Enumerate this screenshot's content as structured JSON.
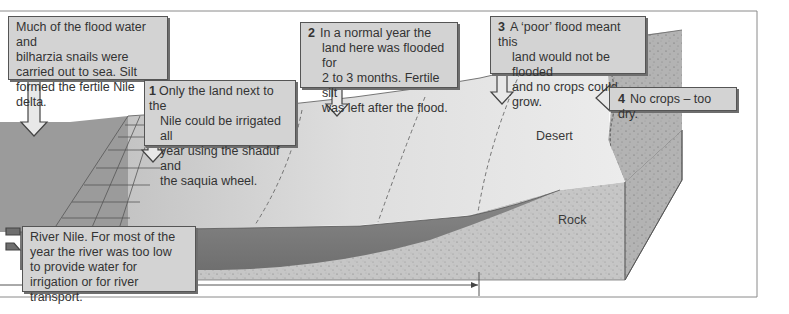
{
  "diagram": {
    "colors": {
      "river": "#7d7d7d",
      "delta_water": "#9a9a9a",
      "flood_land": "#c9c9c9",
      "desert": "#e6e6e6",
      "rock": "#c4c4c4",
      "callout_fill": "#d3d3d3",
      "frame": "#8a8a8a"
    },
    "callouts": [
      {
        "id": "delta",
        "number": "",
        "lines": [
          "Much of the flood water and",
          "bilharzia snails were",
          "carried out to sea. Silt",
          "formed the fertile Nile delta."
        ]
      },
      {
        "id": "irrigated",
        "number": "1",
        "lines": [
          "Only the land next to the",
          "Nile could be irrigated all",
          "year using the shaduf and",
          "the saquia wheel."
        ]
      },
      {
        "id": "normal-flood",
        "number": "2",
        "lines": [
          "In a normal year the",
          "land here was flooded for",
          "2 to 3 months. Fertile silt",
          "was left after the flood."
        ]
      },
      {
        "id": "poor-flood",
        "number": "3",
        "lines": [
          "A ‘poor’ flood meant this",
          "land would not be flooded",
          "and no crops could grow."
        ]
      },
      {
        "id": "too-dry",
        "number": "4",
        "lines": [
          "No crops – too dry."
        ]
      },
      {
        "id": "river-nile",
        "number": "",
        "lines": [
          "River Nile. For most of the",
          "year the river was too low",
          "to provide water for",
          "irrigation or for river transport."
        ]
      }
    ],
    "labels": {
      "desert": "Desert",
      "rock": "Rock"
    }
  }
}
